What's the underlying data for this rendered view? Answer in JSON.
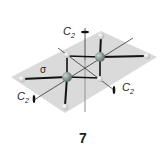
{
  "figure": {
    "compound_number": "7",
    "labels": {
      "c2_vertical": {
        "main": "C",
        "sub": "2"
      },
      "c2_left": {
        "main": "C",
        "sub": "2"
      },
      "c2_right": {
        "main": "C",
        "sub": "2"
      },
      "mirror_plane": "σ"
    },
    "colors": {
      "plane": "#d4d4d4",
      "bond": "#1a1a1a",
      "heavy_atom": "#8a9a96",
      "light_atom": "#e6e6e6",
      "axis": "#333333"
    }
  }
}
